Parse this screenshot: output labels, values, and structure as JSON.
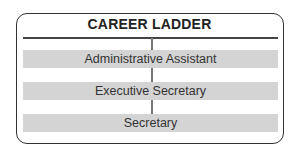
{
  "diagram": {
    "title": "CAREER LADDER",
    "steps": [
      {
        "label": "Administrative Assistant"
      },
      {
        "label": "Executive Secretary"
      },
      {
        "label": "Secretary"
      }
    ]
  },
  "colors": {
    "border": "#333333",
    "bar_fill": "#d4d4d4",
    "connector": "#777777"
  }
}
